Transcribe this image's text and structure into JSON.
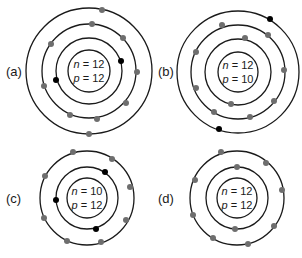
{
  "colors": {
    "ring": "#1a1a1a",
    "electron_gray": "#6e6e6e",
    "electron_black": "#000000"
  },
  "atoms": [
    {
      "id": "a",
      "label": "(a)",
      "n_text": "n = 12",
      "p_text": "p = 12",
      "n_var": "n",
      "n_val": " = 12",
      "p_var": "p",
      "p_val": " = 12",
      "center": [
        89,
        71
      ],
      "label_pos": [
        6,
        76
      ],
      "nucleus_radius": 21,
      "rings": [
        33,
        47,
        63
      ],
      "electrons": [
        {
          "x": 121,
          "y": 61,
          "color": "black"
        },
        {
          "x": 56,
          "y": 80,
          "color": "black"
        },
        {
          "x": 92,
          "y": 24,
          "color": "gray"
        },
        {
          "x": 123,
          "y": 38,
          "color": "gray"
        },
        {
          "x": 51,
          "y": 44,
          "color": "gray"
        },
        {
          "x": 137,
          "y": 72,
          "color": "gray"
        },
        {
          "x": 44,
          "y": 86,
          "color": "gray"
        },
        {
          "x": 126,
          "y": 103,
          "color": "gray"
        },
        {
          "x": 70,
          "y": 115,
          "color": "gray"
        },
        {
          "x": 97,
          "y": 119,
          "color": "gray"
        },
        {
          "x": 102,
          "y": 10,
          "color": "gray"
        },
        {
          "x": 89,
          "y": 134,
          "color": "gray"
        }
      ]
    },
    {
      "id": "b",
      "label": "(b)",
      "n_text": "n = 12",
      "p_text": "p = 10",
      "n_var": "n",
      "n_val": " = 12",
      "p_var": "p",
      "p_val": " = 10",
      "center": [
        238,
        72
      ],
      "label_pos": [
        158,
        76
      ],
      "nucleus_radius": 20,
      "rings": [
        33,
        47,
        61
      ],
      "electrons": [
        {
          "x": 245,
          "y": 38,
          "color": "gray"
        },
        {
          "x": 231,
          "y": 104,
          "color": "gray"
        },
        {
          "x": 222,
          "y": 25,
          "color": "gray"
        },
        {
          "x": 268,
          "y": 35,
          "color": "gray"
        },
        {
          "x": 196,
          "y": 52,
          "color": "gray"
        },
        {
          "x": 284,
          "y": 70,
          "color": "gray"
        },
        {
          "x": 196,
          "y": 88,
          "color": "gray"
        },
        {
          "x": 274,
          "y": 101,
          "color": "gray"
        },
        {
          "x": 214,
          "y": 112,
          "color": "gray"
        },
        {
          "x": 250,
          "y": 117,
          "color": "gray"
        },
        {
          "x": 270,
          "y": 19,
          "color": "black"
        },
        {
          "x": 219,
          "y": 129,
          "color": "black"
        }
      ]
    },
    {
      "id": "c",
      "label": "(c)",
      "n_text": "n = 10",
      "p_text": "p = 12",
      "n_var": "n",
      "n_val": " = 10",
      "p_var": "p",
      "p_val": " = 12",
      "center": [
        87,
        198
      ],
      "label_pos": [
        6,
        203
      ],
      "nucleus_radius": 20,
      "rings": [
        31,
        47
      ],
      "electrons": [
        {
          "x": 105,
          "y": 172,
          "color": "black"
        },
        {
          "x": 56,
          "y": 200,
          "color": "black"
        },
        {
          "x": 96,
          "y": 229,
          "color": "black"
        },
        {
          "x": 73,
          "y": 152,
          "color": "gray"
        },
        {
          "x": 112,
          "y": 159,
          "color": "gray"
        },
        {
          "x": 130,
          "y": 187,
          "color": "gray"
        },
        {
          "x": 126,
          "y": 220,
          "color": "gray"
        },
        {
          "x": 101,
          "y": 242,
          "color": "gray"
        },
        {
          "x": 67,
          "y": 241,
          "color": "gray"
        },
        {
          "x": 44,
          "y": 218,
          "color": "gray"
        },
        {
          "x": 45,
          "y": 176,
          "color": "gray"
        }
      ]
    },
    {
      "id": "d",
      "label": "(d)",
      "n_text": "n = 12",
      "p_text": "p = 12",
      "n_var": "n",
      "n_val": " = 12",
      "p_var": "p",
      "p_val": " = 12",
      "center": [
        237,
        198
      ],
      "label_pos": [
        158,
        203
      ],
      "nucleus_radius": 20,
      "rings": [
        31,
        47
      ],
      "electrons": [
        {
          "x": 237,
          "y": 167,
          "color": "gray"
        },
        {
          "x": 235,
          "y": 229,
          "color": "gray"
        },
        {
          "x": 221,
          "y": 152,
          "color": "gray"
        },
        {
          "x": 266,
          "y": 163,
          "color": "gray"
        },
        {
          "x": 282,
          "y": 190,
          "color": "gray"
        },
        {
          "x": 274,
          "y": 226,
          "color": "gray"
        },
        {
          "x": 248,
          "y": 244,
          "color": "gray"
        },
        {
          "x": 213,
          "y": 238,
          "color": "gray"
        },
        {
          "x": 193,
          "y": 215,
          "color": "gray"
        },
        {
          "x": 195,
          "y": 180,
          "color": "gray"
        }
      ]
    }
  ]
}
